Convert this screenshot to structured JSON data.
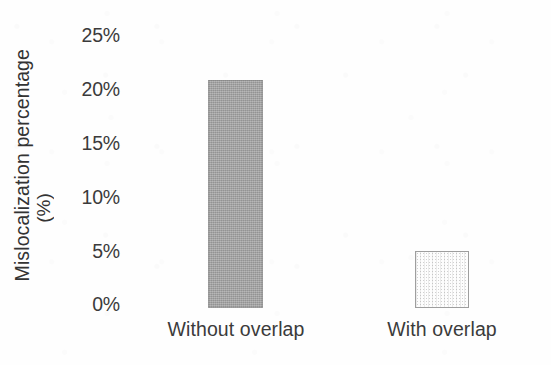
{
  "chart_data": {
    "type": "bar",
    "title": "",
    "subtitle": "",
    "xlabel": "",
    "ylabel": "Mislocalization percentage (%)",
    "ylabel_lines": [
      "Mislocalization percentage",
      "(%)"
    ],
    "categories": [
      "Without overlap",
      "With overlap"
    ],
    "values": [
      21,
      5.2
    ],
    "value_labels": [
      "",
      ""
    ],
    "ylim": [
      0,
      25
    ],
    "ytick_values": [
      0,
      5,
      10,
      15,
      20,
      25
    ],
    "ytick_labels": [
      "0%",
      "5%",
      "10%",
      "15%",
      "20%",
      "25%"
    ],
    "grid": false,
    "axis_lines": false,
    "legend": null,
    "legend_position": "none",
    "bar_styles": [
      {
        "name": "solid-gray",
        "fill": "#a2a2a2",
        "border": "#8f8f8f",
        "pattern": "solid"
      },
      {
        "name": "dotted-white",
        "fill": "#fdfdfd",
        "border": "#9e9e9e",
        "pattern": "dotted"
      }
    ],
    "colors": {
      "background": "#fefefe",
      "text": "#3b3b3b",
      "bar_without_overlap": "#a2a2a2",
      "bar_with_overlap": "#fdfdfd"
    }
  }
}
